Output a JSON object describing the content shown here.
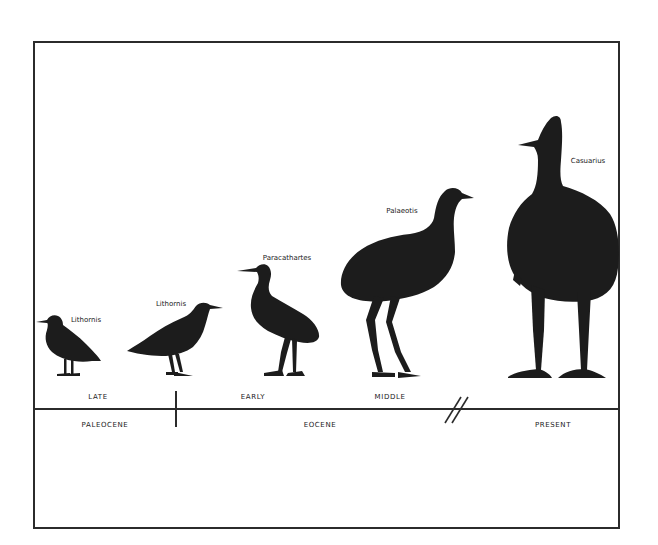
{
  "figure": {
    "species": [
      {
        "name": "Lithornis",
        "label_x": 86,
        "label_y": 316
      },
      {
        "name": "Lithornis",
        "label_x": 171,
        "label_y": 300
      },
      {
        "name": "Paracathartes",
        "label_x": 287,
        "label_y": 254
      },
      {
        "name": "Palaeotis",
        "label_x": 402,
        "label_y": 207
      },
      {
        "name": "Casuarius",
        "label_x": 586,
        "label_y": 157
      }
    ],
    "epoch_subdivisions": [
      {
        "label": "LATE",
        "x": 98
      },
      {
        "label": "EARLY",
        "x": 253
      },
      {
        "label": "MIDDLE",
        "x": 390
      }
    ],
    "epochs": [
      {
        "label": "PALEOCENE",
        "x": 105
      },
      {
        "label": "EOCENE",
        "x": 320
      },
      {
        "label": "PRESENT",
        "x": 553
      }
    ],
    "time_break_symbol": "//",
    "silhouette_color": "#1c1c1c",
    "line_color": "#2b2b2b"
  }
}
